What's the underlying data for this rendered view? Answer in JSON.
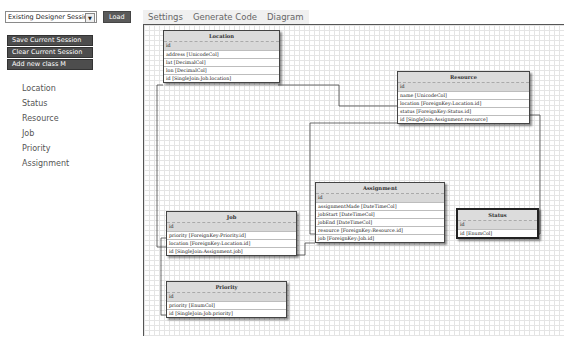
{
  "session": {
    "select_value": "Existing Designer Session",
    "load_label": "Load"
  },
  "actions": [
    {
      "label": "Save Current Session"
    },
    {
      "label": "Clear Current Session"
    },
    {
      "label": "Add new class M"
    }
  ],
  "classes_list": [
    "Location",
    "Status",
    "Resource",
    "Job",
    "Priority",
    "Assignment"
  ],
  "tabs": [
    {
      "label": "Settings",
      "accel": "t"
    },
    {
      "label": "Generate Code",
      "accel": "G"
    },
    {
      "label": "Diagram",
      "accel": "D"
    }
  ],
  "diagram": {
    "location": {
      "title": "Location",
      "rows": [
        "id",
        "address [UnicodeCol]",
        "lat [DecimalCol]",
        "lon [DecimalCol]",
        "id [SingleJoin:Job.location]"
      ]
    },
    "resource": {
      "title": "Resource",
      "rows": [
        "id",
        "name [UnicodeCol]",
        "location [ForeignKey:Location.id]",
        "status [ForeignKey:Status.id]",
        "id [SingleJoin:Assignment.resource]"
      ]
    },
    "assignment": {
      "title": "Assignment",
      "rows": [
        "id",
        "assignmentMade [DateTimeCol]",
        "jobStart [DateTimeCol]",
        "jobEnd [DateTimeCol]",
        "resource [ForeignKey:Resource.id]",
        "job [ForeignKey:Job.id]"
      ]
    },
    "job": {
      "title": "Job",
      "rows": [
        "id",
        "priority [ForeignKey:Priority.id]",
        "location [ForeignKey:Location.id]",
        "id [SingleJoin:Assignment.job]"
      ]
    },
    "status": {
      "title": "Status",
      "rows": [
        "id",
        "id [EnumCol]"
      ]
    },
    "priority": {
      "title": "Priority",
      "rows": [
        "id",
        "priority [EnumCol]",
        "id [SingleJoin:Job.priority]"
      ]
    }
  }
}
